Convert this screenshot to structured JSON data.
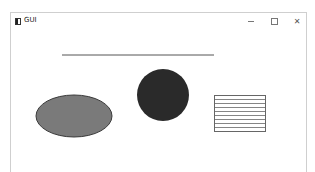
{
  "window": {
    "title": "GUI",
    "controls": {
      "minimize": "minimize",
      "maximize": "maximize",
      "close": "close"
    }
  },
  "canvas": {
    "shapes": [
      {
        "type": "line",
        "x1": 62,
        "y1": 55,
        "x2": 214,
        "y2": 55,
        "stroke": "#555555"
      },
      {
        "type": "circle",
        "cx": 163,
        "cy": 95,
        "r": 26,
        "fill": "#2a2a2a"
      },
      {
        "type": "ellipse",
        "cx": 74,
        "cy": 116,
        "rx": 38,
        "ry": 21,
        "fill": "#7a7a7a",
        "stroke": "#3a3a3a"
      },
      {
        "type": "rect",
        "x": 214,
        "y": 95,
        "width": 51,
        "height": 36,
        "stroke": "#666666",
        "hatch_lines": 9
      }
    ]
  }
}
